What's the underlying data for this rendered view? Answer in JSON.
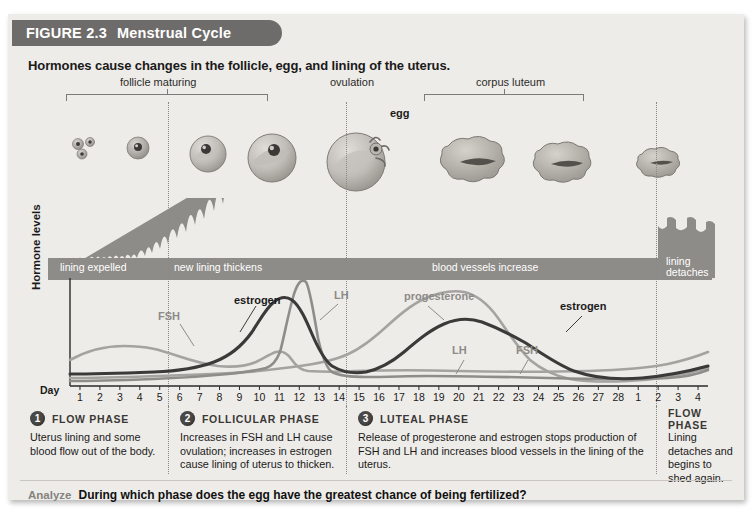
{
  "banner": {
    "figure_number": "FIGURE 2.3",
    "title": "Menstrual Cycle"
  },
  "subtitle": "Hormones cause changes in the follicle, egg, and lining of the uterus.",
  "stage": {
    "group_labels": [
      {
        "text": "follicle maturing"
      },
      {
        "text": "ovulation"
      },
      {
        "text": "corpus luteum"
      }
    ],
    "egg_label": "egg"
  },
  "lining": {
    "segments": [
      {
        "text": "lining expelled"
      },
      {
        "text": "new lining thickens"
      },
      {
        "text": "blood vessels increase"
      },
      {
        "text": "lining detaches"
      }
    ]
  },
  "chart_axis": {
    "y_label": "Hormone levels",
    "day_label": "Day",
    "day_ticks": [
      "1",
      "2",
      "3",
      "4",
      "5",
      "6",
      "7",
      "8",
      "9",
      "10",
      "11",
      "12",
      "13",
      "14",
      "15",
      "16",
      "17",
      "18",
      "19",
      "20",
      "21",
      "22",
      "23",
      "24",
      "25",
      "26",
      "27",
      "28",
      "1",
      "2",
      "3",
      "4"
    ]
  },
  "curve_labels": [
    {
      "name": "FSH",
      "style": "gray"
    },
    {
      "name": "estrogen",
      "style": "dark"
    },
    {
      "name": "LH",
      "style": "gray"
    },
    {
      "name": "progesterone",
      "style": "gray"
    },
    {
      "name": "LH",
      "style": "gray"
    },
    {
      "name": "FSH",
      "style": "gray"
    },
    {
      "name": "estrogen",
      "style": "dark"
    }
  ],
  "phases": [
    {
      "number": "1",
      "name": "FLOW PHASE",
      "description": "Uterus lining and some blood flow out of the body."
    },
    {
      "number": "2",
      "name": "FOLLICULAR PHASE",
      "description": "Increases in FSH and LH cause ovulation; increases in estrogen cause lining of uterus to thicken."
    },
    {
      "number": "3",
      "name": "LUTEAL PHASE",
      "description": "Release of progesterone and estrogen stops production of FSH and LH and increases blood vessels in the lining of the uterus."
    },
    {
      "number": "",
      "name": "FLOW PHASE",
      "description": "Lining detaches and begins to shed again."
    }
  ],
  "analyze": {
    "label": "Analyze",
    "question": "During which phase does the egg have the greatest chance of being fertilized?"
  },
  "colors": {
    "banner_bg": "#6e6c6a",
    "figure_bg": "#eeece8",
    "lining_gray": "#8e8c88",
    "estrogen": "#3b3a38",
    "fsh": "#a5a3a0",
    "lh": "#8f8d8a",
    "progesterone": "#a5a3a0",
    "badge": "#4a4846"
  },
  "chart_data": {
    "type": "line",
    "xlabel": "Day",
    "ylabel": "Hormone levels",
    "x": [
      1,
      2,
      3,
      4,
      5,
      6,
      7,
      8,
      9,
      10,
      11,
      12,
      13,
      14,
      15,
      16,
      17,
      18,
      19,
      20,
      21,
      22,
      23,
      24,
      25,
      26,
      27,
      28,
      29,
      30,
      31,
      32
    ],
    "xtick_labels": [
      "1",
      "2",
      "3",
      "4",
      "5",
      "6",
      "7",
      "8",
      "9",
      "10",
      "11",
      "12",
      "13",
      "14",
      "15",
      "16",
      "17",
      "18",
      "19",
      "20",
      "21",
      "22",
      "23",
      "24",
      "25",
      "26",
      "27",
      "28",
      "1",
      "2",
      "3",
      "4"
    ],
    "ylim": [
      0,
      100
    ],
    "grid": false,
    "legend": "inline-annotations",
    "series": [
      {
        "name": "FSH",
        "color": "#a5a3a0",
        "values": [
          26,
          30,
          32,
          32,
          31,
          29,
          27,
          25,
          23,
          22,
          22,
          28,
          34,
          26,
          20,
          18,
          17,
          16,
          15,
          15,
          15,
          15,
          15,
          15,
          16,
          17,
          19,
          22,
          25,
          28,
          30,
          32
        ]
      },
      {
        "name": "estrogen",
        "color": "#3b3a38",
        "values": [
          12,
          12,
          12,
          13,
          14,
          16,
          19,
          24,
          33,
          48,
          66,
          72,
          60,
          36,
          24,
          26,
          32,
          40,
          47,
          52,
          55,
          56,
          55,
          50,
          40,
          28,
          20,
          16,
          14,
          13,
          12,
          13
        ]
      },
      {
        "name": "LH",
        "color": "#8f8d8a",
        "values": [
          8,
          8,
          8,
          9,
          9,
          10,
          11,
          12,
          13,
          14,
          16,
          55,
          92,
          30,
          14,
          13,
          13,
          14,
          15,
          16,
          17,
          17,
          17,
          17,
          17,
          17,
          17,
          17,
          16,
          16,
          17,
          20
        ]
      },
      {
        "name": "progesterone",
        "color": "#a5a3a0",
        "values": [
          7,
          7,
          7,
          7,
          7,
          8,
          8,
          9,
          10,
          12,
          14,
          17,
          20,
          24,
          30,
          38,
          50,
          62,
          72,
          80,
          84,
          82,
          75,
          64,
          50,
          36,
          24,
          16,
          12,
          10,
          10,
          12
        ]
      }
    ],
    "annotations": [
      {
        "text": "ovulation",
        "day": 14
      },
      {
        "text": "follicle maturing",
        "day_range": [
          6,
          13
        ]
      },
      {
        "text": "corpus luteum",
        "day_range": [
          16,
          25
        ]
      },
      {
        "text": "lining expelled",
        "day_range": [
          1,
          5
        ]
      },
      {
        "text": "new lining thickens",
        "day_range": [
          6,
          14
        ]
      },
      {
        "text": "blood vessels increase",
        "day_range": [
          15,
          28
        ]
      },
      {
        "text": "lining detaches",
        "day_range": [
          29,
          32
        ]
      }
    ]
  }
}
